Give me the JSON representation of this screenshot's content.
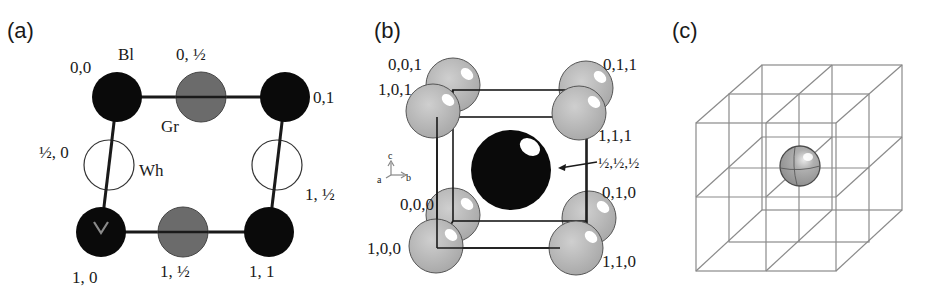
{
  "figure": {
    "panels": [
      {
        "id": "a",
        "label": "(a)",
        "description": "2D square lattice with black, gray and white sites",
        "species_labels": {
          "black": "Bl",
          "gray": "Gr",
          "white": "Wh"
        },
        "site_labels": {
          "top_left": "0,0",
          "top_mid": "0, ½",
          "top_right": "0,1",
          "left_mid": "½, 0",
          "right_mid": "1, ½",
          "bottom_left": "1, 0",
          "bottom_mid": "1, ½",
          "bottom_right": "1, 1"
        }
      },
      {
        "id": "b",
        "label": "(b)",
        "description": "Body-centered cubic cell with gray corner atoms and black body-center atom",
        "site_labels": {
          "c001": "0,0,1",
          "c101": "1,0,1",
          "c011": "0,1,1",
          "c111": "1,1,1",
          "center": "½,½,½",
          "c010": "0,1,0",
          "c000": "0,0,0",
          "c100": "1,0,0",
          "c110": "1,1,0"
        },
        "axes": {
          "a": "a",
          "b": "b",
          "c": "c"
        }
      },
      {
        "id": "c",
        "label": "(c)",
        "description": "2×2×2 wireframe cube with single gray sphere at the center"
      }
    ],
    "colors": {
      "black_atom": "#0a0a0a",
      "gray_atom_a": "#6b6b6b",
      "gray_atom_b": "#b4b4b4",
      "white_atom": "#ffffff",
      "lines": "#1a1a1a",
      "wire_c": "#8a8a8a"
    }
  }
}
